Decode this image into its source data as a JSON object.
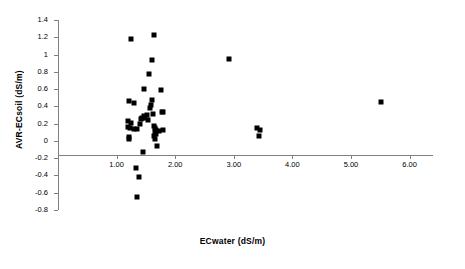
{
  "chart_data": {
    "type": "scatter",
    "title": "",
    "xlabel": "ECwater (dS/m)",
    "ylabel": "AVR-ECsoil (dS/m)",
    "xlim": [
      0.0,
      6.4
    ],
    "ylim": [
      -0.8,
      1.4
    ],
    "grid": false,
    "legend": "none",
    "marker": "filled-square",
    "marker_color": "#000000",
    "axis_color": "#808080",
    "xticks": [
      1.0,
      2.0,
      3.0,
      4.0,
      5.0,
      6.0
    ],
    "xticklabels": [
      "1.00",
      "2.00",
      "3.00",
      "4.00",
      "5.00",
      "6.00"
    ],
    "yticks": [
      -0.8,
      -0.6,
      -0.4,
      -0.2,
      0,
      0.2,
      0.4,
      0.6,
      0.8,
      1.0,
      1.2,
      1.4
    ],
    "yticklabels": [
      "-0.8",
      "-0.6",
      "-0.4",
      "-0.2",
      "0",
      "0.2",
      "0.4",
      "0.6",
      "0.8",
      "1",
      "1.2",
      "1.4"
    ],
    "series": [
      {
        "name": "AVR-ECsoil vs ECwater",
        "points": [
          [
            1.24,
            1.18
          ],
          [
            1.63,
            1.23
          ],
          [
            2.91,
            0.95
          ],
          [
            1.6,
            0.94
          ],
          [
            1.55,
            0.77
          ],
          [
            1.47,
            0.6
          ],
          [
            1.75,
            0.59
          ],
          [
            1.22,
            0.46
          ],
          [
            1.3,
            0.44
          ],
          [
            5.52,
            0.45
          ],
          [
            1.61,
            0.47
          ],
          [
            1.58,
            0.42
          ],
          [
            1.57,
            0.38
          ],
          [
            1.78,
            0.34
          ],
          [
            1.8,
            0.33
          ],
          [
            1.62,
            0.31
          ],
          [
            1.52,
            0.3
          ],
          [
            1.46,
            0.29
          ],
          [
            1.44,
            0.27
          ],
          [
            1.49,
            0.26
          ],
          [
            1.42,
            0.25
          ],
          [
            1.54,
            0.24
          ],
          [
            1.2,
            0.23
          ],
          [
            1.24,
            0.21
          ],
          [
            1.4,
            0.2
          ],
          [
            1.19,
            0.16
          ],
          [
            1.23,
            0.15
          ],
          [
            1.35,
            0.14
          ],
          [
            1.3,
            0.14
          ],
          [
            1.64,
            0.17
          ],
          [
            1.66,
            0.15
          ],
          [
            1.68,
            0.13
          ],
          [
            1.8,
            0.13
          ],
          [
            1.72,
            0.12
          ],
          [
            1.65,
            0.1
          ],
          [
            1.67,
            0.08
          ],
          [
            1.63,
            0.06
          ],
          [
            1.21,
            0.05
          ],
          [
            1.22,
            0.02
          ],
          [
            1.66,
            0.02
          ],
          [
            3.4,
            0.15
          ],
          [
            3.44,
            0.13
          ],
          [
            3.43,
            0.06
          ],
          [
            1.69,
            -0.06
          ],
          [
            1.45,
            -0.13
          ],
          [
            1.33,
            -0.31
          ],
          [
            1.38,
            -0.42
          ],
          [
            1.35,
            -0.65
          ]
        ]
      }
    ]
  }
}
